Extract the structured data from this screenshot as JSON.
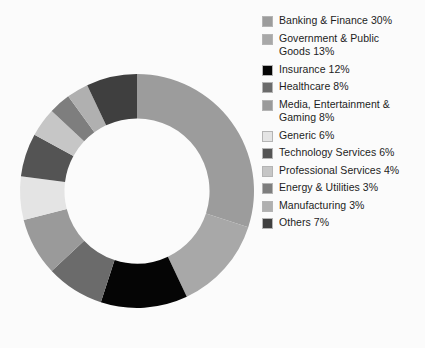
{
  "chart_data": {
    "type": "pie",
    "variant": "donut",
    "title": "",
    "subtitle": "",
    "xlabel": "",
    "ylabel": "",
    "units": "percent",
    "total": 100,
    "start_angle_deg": 0,
    "direction": "clockwise",
    "inner_radius_ratio": 0.62,
    "legend_position": "right",
    "grid": false,
    "background_color": "#fbfbfb",
    "categories": [
      "Banking & Finance",
      "Government & Public Goods",
      "Insurance",
      "Healthcare",
      "Media, Entertainment & Gaming",
      "Generic",
      "Technology Services",
      "Professional Services",
      "Energy & Utilities",
      "Manufacturing",
      "Others"
    ],
    "values": [
      30,
      13,
      12,
      8,
      8,
      6,
      6,
      4,
      3,
      3,
      7
    ],
    "colors": [
      "#9c9c9c",
      "#a8a8a8",
      "#050505",
      "#6b6b6b",
      "#9a9a9a",
      "#e4e4e4",
      "#545454",
      "#c6c6c6",
      "#7e7e7e",
      "#b0b0b0",
      "#3f3f3f"
    ]
  },
  "legend": {
    "items": [
      {
        "label": "Banking & Finance 30%",
        "color": "#9c9c9c",
        "swatch_name": "legend-swatch-banking-finance"
      },
      {
        "label": "Government & Public\nGoods 13%",
        "color": "#a8a8a8",
        "swatch_name": "legend-swatch-government-public-goods"
      },
      {
        "label": "Insurance 12%",
        "color": "#050505",
        "swatch_name": "legend-swatch-insurance"
      },
      {
        "label": "Healthcare 8%",
        "color": "#6b6b6b",
        "swatch_name": "legend-swatch-healthcare"
      },
      {
        "label": "Media, Entertainment &\nGaming 8%",
        "color": "#9a9a9a",
        "swatch_name": "legend-swatch-media-entertainment-gaming"
      },
      {
        "label": "Generic 6%",
        "color": "#e4e4e4",
        "swatch_name": "legend-swatch-generic"
      },
      {
        "label": "Technology Services 6%",
        "color": "#545454",
        "swatch_name": "legend-swatch-technology-services"
      },
      {
        "label": "Professional Services 4%",
        "color": "#c6c6c6",
        "swatch_name": "legend-swatch-professional-services"
      },
      {
        "label": "Energy & Utilities 3%",
        "color": "#7e7e7e",
        "swatch_name": "legend-swatch-energy-utilities"
      },
      {
        "label": "Manufacturing 3%",
        "color": "#b0b0b0",
        "swatch_name": "legend-swatch-manufacturing"
      },
      {
        "label": "Others 7%",
        "color": "#3f3f3f",
        "swatch_name": "legend-swatch-others"
      }
    ]
  }
}
